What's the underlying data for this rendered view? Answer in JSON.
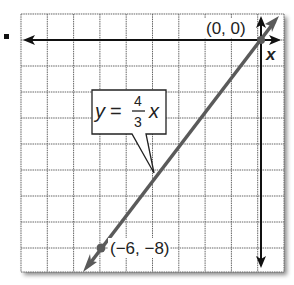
{
  "graph": {
    "equation": {
      "lhs": "y",
      "equals": "=",
      "numerator": "4",
      "denominator": "3",
      "var": "x"
    },
    "points": [
      {
        "label": "(0, 0)",
        "x": 0,
        "y": 0
      },
      {
        "label": "(−6, −8)",
        "x": -6,
        "y": -8
      }
    ],
    "axis_label_x": "x",
    "bullet": "■",
    "colors": {
      "grid": "#555555",
      "axis": "#111111",
      "line": "#555555",
      "background": "#ffffff"
    },
    "grid": {
      "columns": 10,
      "rows": 10,
      "unit": 1
    }
  }
}
